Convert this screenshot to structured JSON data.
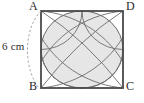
{
  "figure": {
    "type": "geometry-diagram",
    "background_color": "#ffffff",
    "square": {
      "stroke_color": "#4a4a4a",
      "fill_color": "#ffffff",
      "side_length_value": 6,
      "side_length_unit": "cm",
      "vertices": [
        {
          "key": "A",
          "label": "A",
          "position": "top-left"
        },
        {
          "key": "D",
          "label": "D",
          "position": "top-right"
        },
        {
          "key": "C",
          "label": "C",
          "position": "bottom-right"
        },
        {
          "key": "B",
          "label": "B",
          "position": "bottom-left"
        }
      ]
    },
    "arcs": {
      "count": 4,
      "stroke_color": "#6d6d6d",
      "radius_description": "half of the side length",
      "centres": [
        "A",
        "D",
        "C",
        "B"
      ]
    },
    "shaded_region": {
      "name": "quatrefoil",
      "fill_color": "#e6e6e6",
      "stroke_color": "#5a5a5a"
    },
    "dimension": {
      "label": "6 cm",
      "applies_to_side": "AB",
      "leader_style": "dashed-arc",
      "leader_color": "#9a9a9a"
    },
    "labels": {
      "A": "A",
      "B": "B",
      "C": "C",
      "D": "D",
      "dimension": "6 cm"
    }
  }
}
